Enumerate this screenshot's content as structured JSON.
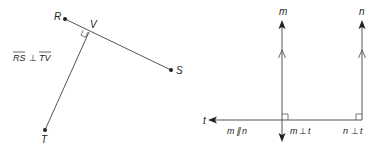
{
  "left_diagram": {
    "points": [
      {
        "name": "R",
        "label": "R"
      },
      {
        "name": "S",
        "label": "S"
      },
      {
        "name": "T",
        "label": "T"
      },
      {
        "name": "V",
        "label": "V"
      }
    ],
    "segments": [
      "RS",
      "TV"
    ],
    "statement": {
      "seg1": "RS",
      "symbol": "⊥",
      "seg2": "TV"
    }
  },
  "right_diagram": {
    "lines": [
      {
        "name": "m",
        "label": "m"
      },
      {
        "name": "n",
        "label": "n"
      },
      {
        "name": "t",
        "label": "t"
      }
    ],
    "statements": [
      {
        "a": "m",
        "symbol": "∥",
        "b": "n"
      },
      {
        "a": "m",
        "symbol": "⊥",
        "b": "t"
      },
      {
        "a": "n",
        "symbol": "⊥",
        "b": "t"
      }
    ]
  }
}
